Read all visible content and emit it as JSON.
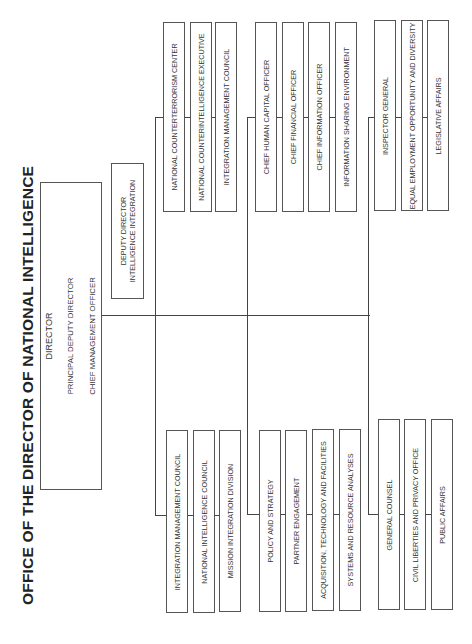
{
  "title": "OFFICE OF THE DIRECTOR OF NATIONAL INTELLIGENCE",
  "director_box": {
    "lines": [
      "DIRECTOR",
      "PRINCIPAL DEPUTY DIRECTOR",
      "CHIEF MANAGEMENT OFFICER"
    ]
  },
  "deputy_box": {
    "lines": [
      "DEPUTY DIRECTOR",
      "INTELLIGENCE INTEGRATION"
    ]
  },
  "top_groups": [
    {
      "items": [
        "NATIONAL COUNTERTERRORISM CENTER",
        "NATIONAL COUNTERINTELLIGENCE EXECUTIVE",
        "INTEGRATION MANAGEMENT COUNCIL"
      ]
    },
    {
      "items": [
        "CHIEF HUMAN CAPITAL OFFICER",
        "CHIEF FINANCIAL OFFICER",
        "CHIEF INFORMATION OFFICER",
        "INFORMATION SHARING ENVIRONMENT"
      ]
    },
    {
      "items": [
        "INSPECTOR GENERAL",
        "EQUAL EMPLOYMENT OPPORTUNITY AND DIVERSITY",
        "LEGISLATIVE AFFAIRS"
      ]
    }
  ],
  "bottom_groups": [
    {
      "items": [
        "INTEGRATION MANAGEMENT COUNCIL",
        "NATIONAL INTELLIGENCE COUNCIL",
        "MISSION INTEGRATION DIVISION"
      ]
    },
    {
      "items": [
        "POLICY AND STRATEGY",
        "PARTNER ENGAGEMENT",
        "ACQUISITION, TECHNOLOGY AND FACILITIES",
        "SYSTEMS AND RESOURCE ANALYSES"
      ]
    },
    {
      "items": [
        "GENERAL COUNSEL",
        "CIVIL LIBERTIES AND PRIVACY OFFICE",
        "PUBLIC AFFAIRS"
      ]
    }
  ],
  "colors": {
    "line": "#444444",
    "border": "#555555",
    "text": "#333333",
    "background": "#ffffff"
  }
}
